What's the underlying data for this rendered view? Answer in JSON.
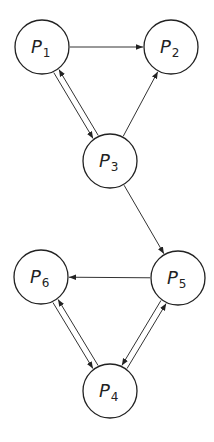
{
  "diagram": {
    "type": "directed-graph",
    "nodes": [
      {
        "id": "P1",
        "base": "P",
        "sub": "1",
        "cx": 42,
        "cy": 47
      },
      {
        "id": "P2",
        "base": "P",
        "sub": "2",
        "cx": 171,
        "cy": 47
      },
      {
        "id": "P3",
        "base": "P",
        "sub": "3",
        "cx": 110,
        "cy": 161
      },
      {
        "id": "P5",
        "base": "P",
        "sub": "5",
        "cx": 178,
        "cy": 278
      },
      {
        "id": "P6",
        "base": "P",
        "sub": "6",
        "cx": 41,
        "cy": 277
      },
      {
        "id": "P4",
        "base": "P",
        "sub": "4",
        "cx": 110,
        "cy": 391
      }
    ],
    "edges": [
      {
        "from": "P1",
        "to": "P2"
      },
      {
        "from": "P1",
        "to": "P3"
      },
      {
        "from": "P3",
        "to": "P1"
      },
      {
        "from": "P3",
        "to": "P2"
      },
      {
        "from": "P3",
        "to": "P5"
      },
      {
        "from": "P5",
        "to": "P6"
      },
      {
        "from": "P6",
        "to": "P4"
      },
      {
        "from": "P4",
        "to": "P6"
      },
      {
        "from": "P5",
        "to": "P4"
      },
      {
        "from": "P4",
        "to": "P5"
      }
    ],
    "node_radius": 27,
    "colors": {
      "stroke": "#222222",
      "fill": "#ffffff",
      "background": "#ffffff"
    }
  }
}
